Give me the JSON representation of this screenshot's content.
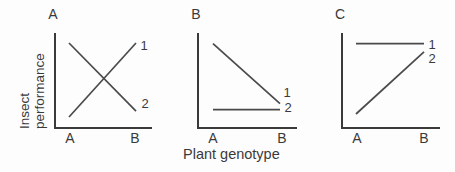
{
  "figure": {
    "ylabel_line1": "Insect",
    "ylabel_line2": "performance",
    "xlabel": "Plant genotype",
    "text_color": "#3a3a3a",
    "line_color": "#4a4a4a",
    "background": "#fdfdfd"
  },
  "chart_data": [
    {
      "type": "line",
      "panel": "A",
      "categories": [
        "A",
        "B"
      ],
      "xlabel": "Plant genotype",
      "ylabel": "Insect performance",
      "ylim": [
        0,
        1
      ],
      "grid": "off",
      "legend": "line-end labels",
      "series": [
        {
          "name": "1",
          "values": [
            0.0,
            1.0
          ]
        },
        {
          "name": "2",
          "values": [
            1.0,
            0.08
          ]
        }
      ]
    },
    {
      "type": "line",
      "panel": "B",
      "categories": [
        "A",
        "B"
      ],
      "xlabel": "Plant genotype",
      "ylabel": "Insect performance",
      "ylim": [
        0,
        1
      ],
      "grid": "off",
      "legend": "line-end labels",
      "series": [
        {
          "name": "1",
          "values": [
            0.99,
            0.18
          ]
        },
        {
          "name": "2",
          "values": [
            0.1,
            0.1
          ]
        }
      ]
    },
    {
      "type": "line",
      "panel": "C",
      "categories": [
        "A",
        "B"
      ],
      "xlabel": "Plant genotype",
      "ylabel": "Insect performance",
      "ylim": [
        0,
        1
      ],
      "grid": "off",
      "legend": "line-end labels",
      "series": [
        {
          "name": "1",
          "values": [
            0.99,
            0.99
          ]
        },
        {
          "name": "2",
          "values": [
            0.04,
            0.88
          ]
        }
      ]
    }
  ]
}
